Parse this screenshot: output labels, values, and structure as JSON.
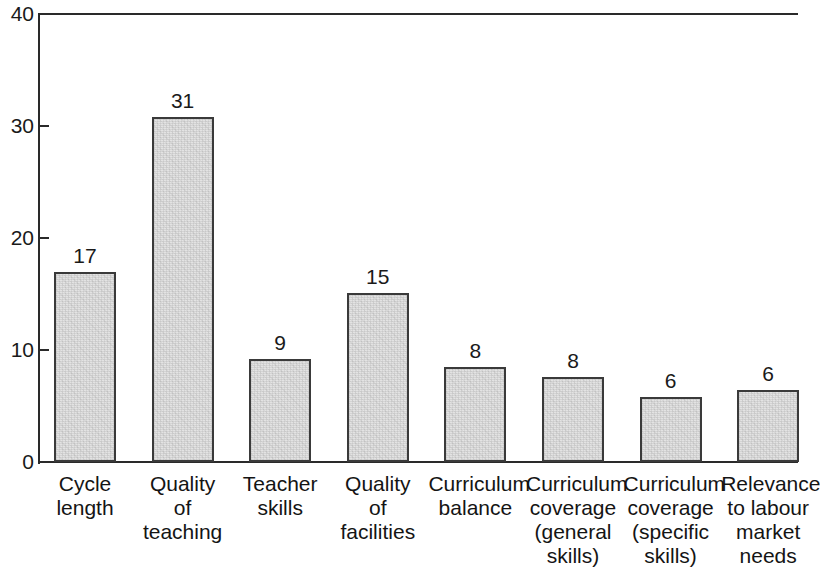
{
  "chart_data": {
    "type": "bar",
    "title": "",
    "subtitle": "",
    "xlabel": "",
    "ylabel": "",
    "ylim": [
      0,
      40
    ],
    "yticks": [
      0,
      10,
      20,
      30,
      40
    ],
    "ytick_labels": [
      "0",
      "10",
      "20",
      "30",
      "40"
    ],
    "grid": false,
    "legend": null,
    "categories": [
      "Cycle\nlength",
      "Quality\nof\nteaching",
      "Teacher\nskills",
      "Quality\nof\nfacilities",
      "Curriculum\nbalance",
      "Curriculum\ncoverage\n(general\nskills)",
      "Curriculum\ncoverage\n(specific\nskills)",
      "Relevance\nto labour\nmarket\nneeds"
    ],
    "values": [
      17,
      31,
      9,
      15,
      8,
      8,
      6,
      6
    ],
    "plotted_heights": [
      17.0,
      30.8,
      9.2,
      15.1,
      8.5,
      7.6,
      5.8,
      6.4
    ],
    "data_labels": [
      "17",
      "31",
      "9",
      "15",
      "8",
      "8",
      "6",
      "6"
    ],
    "bar_fill_color": "#e3e3e3",
    "bar_edge_color": "#3a3a3a",
    "axis_color": "#2a2a2a",
    "background_color": "#ffffff"
  }
}
